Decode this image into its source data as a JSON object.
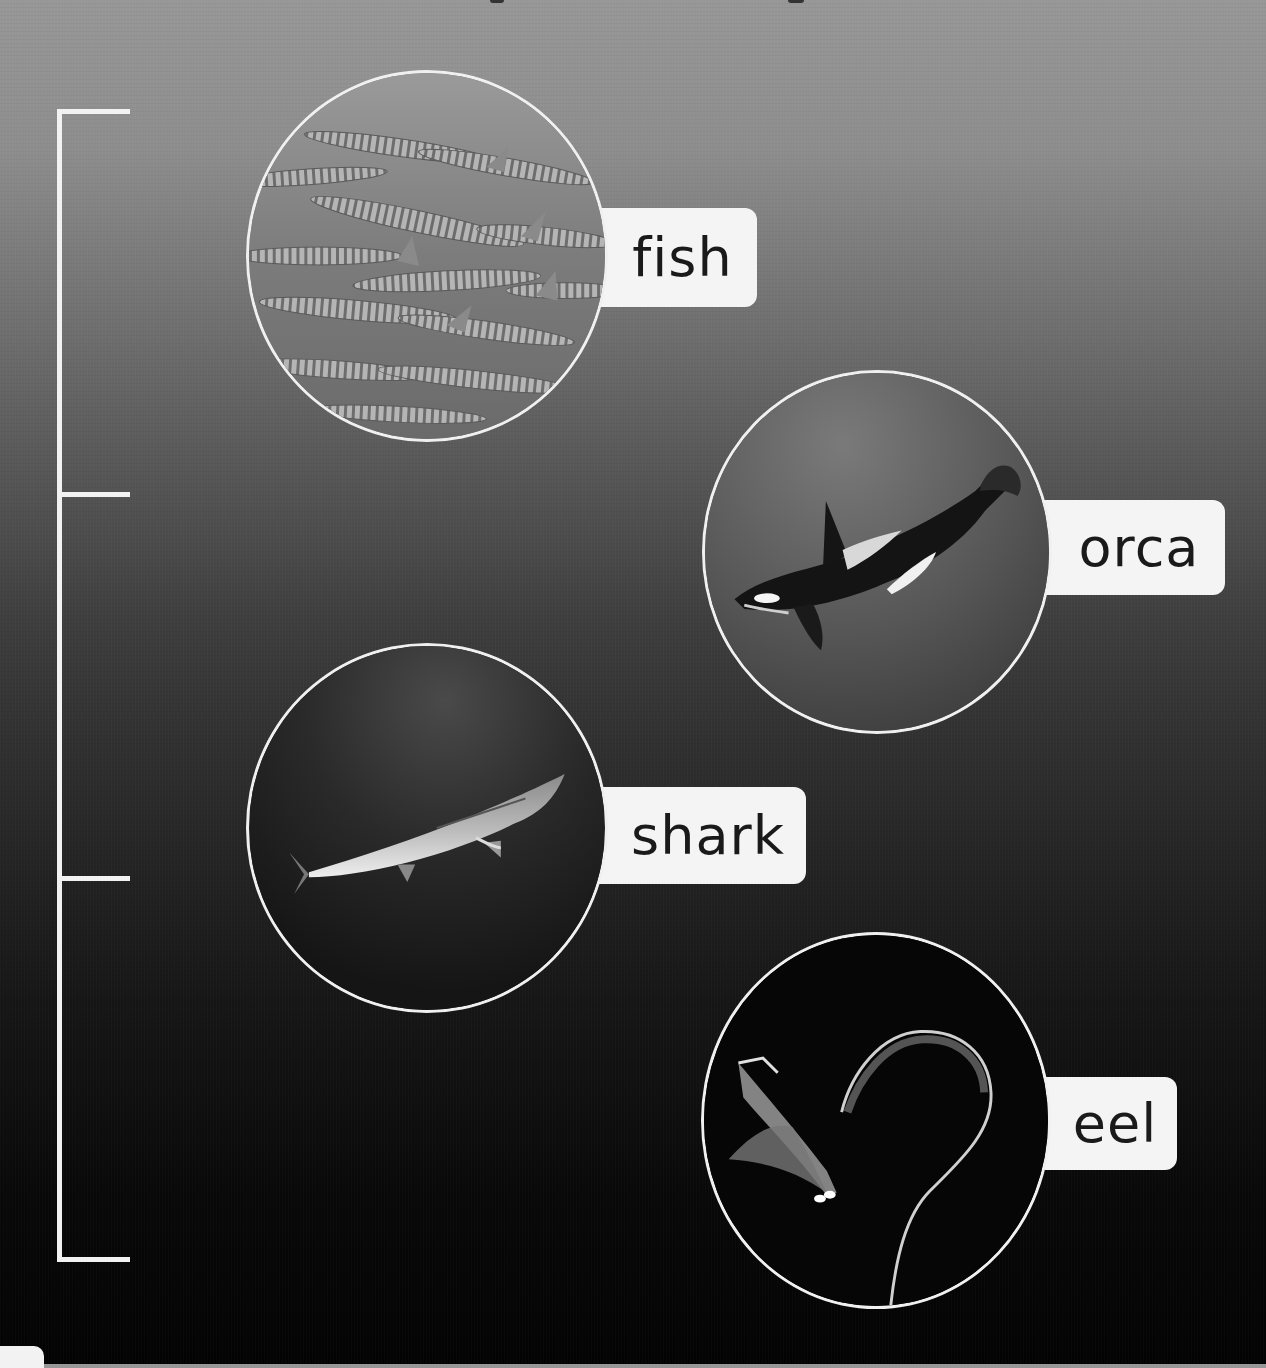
{
  "page": {
    "background_gradient": [
      "#979797",
      "#5f5f5f",
      "#2e2e2e",
      "#080808"
    ],
    "accent_color": "#f2f2f2",
    "label_text_color": "#1a1a1a"
  },
  "bracket": {
    "ticks_y": [
      111,
      494,
      878,
      1259
    ]
  },
  "animals": [
    {
      "id": "fish",
      "label": "fish",
      "image": "school-of-barracuda-photo",
      "circle": {
        "x": 246,
        "y": 68,
        "size": 362
      },
      "label_box": {
        "x": 605,
        "y": 208,
        "w": 152,
        "h": 99
      }
    },
    {
      "id": "orca",
      "label": "orca",
      "image": "orca-killer-whale-photo",
      "circle": {
        "x": 702,
        "y": 370,
        "size": 362
      },
      "label_box": {
        "x": 1045,
        "y": 500,
        "w": 180,
        "h": 95
      }
    },
    {
      "id": "shark",
      "label": "shark",
      "image": "great-white-shark-photo",
      "circle": {
        "x": 246,
        "y": 643,
        "size": 362
      },
      "label_box": {
        "x": 604,
        "y": 787,
        "w": 202,
        "h": 97
      }
    },
    {
      "id": "eel",
      "label": "eel",
      "image": "eel-larva-photo",
      "circle": {
        "x": 701,
        "y": 932,
        "size": 362
      },
      "label_box": {
        "x": 1045,
        "y": 1077,
        "w": 132,
        "h": 93
      }
    }
  ]
}
